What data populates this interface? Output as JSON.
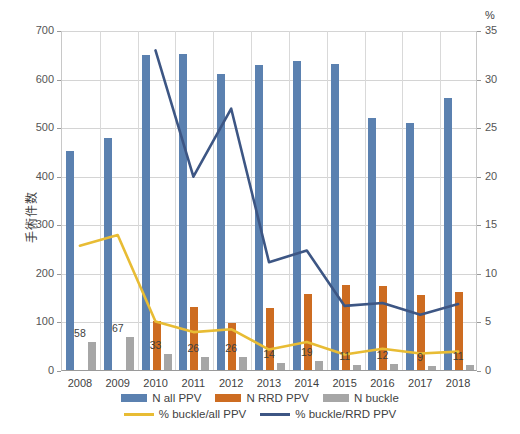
{
  "chart_data": {
    "type": "bar",
    "title": "",
    "subtitle": "",
    "xlabel": "",
    "ylabel": "手術件数",
    "y2label": "%",
    "categories": [
      "2008",
      "2009",
      "2010",
      "2011",
      "2012",
      "2013",
      "2014",
      "2015",
      "2016",
      "2017",
      "2018"
    ],
    "ylim": [
      0,
      700
    ],
    "y2lim": [
      0,
      35
    ],
    "yticks": [
      0,
      100,
      200,
      300,
      400,
      500,
      600,
      700
    ],
    "y2ticks": [
      0,
      5,
      10,
      15,
      20,
      25,
      30,
      35
    ],
    "grid": true,
    "legend_position": "bottom",
    "series": [
      {
        "name": "N all PPV",
        "type": "bar",
        "axis": "left",
        "color": "#5b81b0",
        "values": [
          450,
          478,
          648,
          650,
          610,
          628,
          637,
          630,
          519,
          508,
          560
        ]
      },
      {
        "name": "N RRD PPV",
        "type": "bar",
        "axis": "left",
        "color": "#cd6c21",
        "values": [
          null,
          null,
          100,
          130,
          97,
          128,
          157,
          175,
          172,
          155,
          160
        ]
      },
      {
        "name": "N buckle",
        "type": "bar",
        "axis": "left",
        "color": "#a6a6a6",
        "values": [
          58,
          67,
          33,
          26,
          26,
          14,
          19,
          11,
          12,
          9,
          11
        ]
      },
      {
        "name": "% buckle/all PPV",
        "type": "line",
        "axis": "right",
        "color": "#e8bc34",
        "values": [
          12.9,
          14.0,
          5.1,
          4.0,
          4.3,
          2.2,
          3.0,
          1.7,
          2.3,
          1.8,
          2.0
        ]
      },
      {
        "name": "% buckle/RRD PPV",
        "type": "line",
        "axis": "right",
        "color": "#3d5684",
        "values": [
          null,
          null,
          33.0,
          20.0,
          27.0,
          11.2,
          12.4,
          6.7,
          7.0,
          5.8,
          6.9
        ]
      }
    ],
    "data_labels": {
      "series": "N buckle",
      "values": [
        "58",
        "67",
        "33",
        "26",
        "26",
        "14",
        "19",
        "11",
        "12",
        "9",
        "11"
      ]
    }
  },
  "legend": {
    "row1": [
      {
        "label": "N all PPV",
        "color": "#5b81b0",
        "marker": "bar"
      },
      {
        "label": "N RRD PPV",
        "color": "#cd6c21",
        "marker": "bar"
      },
      {
        "label": "N buckle",
        "color": "#a6a6a6",
        "marker": "bar"
      }
    ],
    "row2": [
      {
        "label": "% buckle/all PPV",
        "color": "#e8bc34",
        "marker": "line"
      },
      {
        "label": "% buckle/RRD PPV",
        "color": "#3d5684",
        "marker": "line"
      }
    ]
  }
}
